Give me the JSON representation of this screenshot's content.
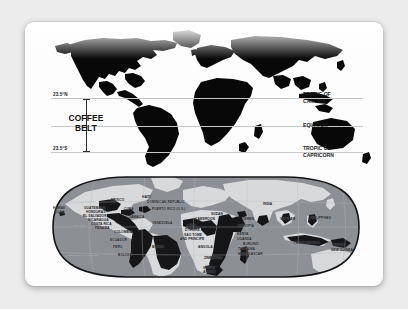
{
  "card": {
    "title": "Coffee Belt World Map"
  },
  "top_map": {
    "belt_label_line1": "COFFEE",
    "belt_label_line2": "BELT",
    "left_labels": {
      "north": "23.5°N",
      "south": "23.5°S"
    },
    "right_labels": {
      "cancer_line1": "TROPIC OF",
      "cancer_line2": "CANCER",
      "equator": "EQUATOR",
      "capricorn_line1": "TROPIC OF",
      "capricorn_line2": "CAPRICORN"
    }
  },
  "bottom_map": {
    "grid_labels": {
      "tropic_cancer": "TROPIC OF CANCER",
      "equator": "EQUATOR",
      "tropic_capricorn": "TROPIC OF CAPRICORN"
    },
    "countries": [
      {
        "name": "HAWAII",
        "x": 18,
        "y": 33,
        "style": ""
      },
      {
        "name": "(U.S.)",
        "x": 20,
        "y": 37,
        "style": ""
      },
      {
        "name": "MEXICO",
        "x": 76,
        "y": 25,
        "style": ""
      },
      {
        "name": "GUATEMALA",
        "x": 49,
        "y": 33,
        "style": ""
      },
      {
        "name": "HONDURAS",
        "x": 51,
        "y": 37,
        "style": ""
      },
      {
        "name": "EL SALVADOR",
        "x": 48,
        "y": 41,
        "style": ""
      },
      {
        "name": "NICARAGUA",
        "x": 53,
        "y": 45,
        "style": ""
      },
      {
        "name": "COSTA RICA",
        "x": 56,
        "y": 49,
        "style": ""
      },
      {
        "name": "PANAMA",
        "x": 60,
        "y": 53,
        "style": ""
      },
      {
        "name": "HAITI",
        "x": 107,
        "y": 22,
        "style": ""
      },
      {
        "name": "DOMINICAN REPUBLIC",
        "x": 112,
        "y": 27,
        "style": ""
      },
      {
        "name": "CUBA",
        "x": 89,
        "y": 34,
        "style": ""
      },
      {
        "name": "PUERTO RICO (U.S.)",
        "x": 117,
        "y": 34,
        "style": ""
      },
      {
        "name": "JAMAICA",
        "x": 94,
        "y": 42,
        "style": ""
      },
      {
        "name": "VENEZUELA",
        "x": 117,
        "y": 48,
        "style": ""
      },
      {
        "name": "COLOMBIA",
        "x": 79,
        "y": 57,
        "style": ""
      },
      {
        "name": "ECUADOR",
        "x": 75,
        "y": 65,
        "style": ""
      },
      {
        "name": "PERU",
        "x": 78,
        "y": 72,
        "style": ""
      },
      {
        "name": "BOLIVIA",
        "x": 83,
        "y": 80,
        "style": ""
      },
      {
        "name": "BRAZIL",
        "x": 117,
        "y": 72,
        "style": ""
      },
      {
        "name": "CÔTE",
        "x": 152,
        "y": 51,
        "style": ""
      },
      {
        "name": "D'IVOIRE",
        "x": 150,
        "y": 55,
        "style": ""
      },
      {
        "name": "SAO TOME",
        "x": 149,
        "y": 60,
        "style": ""
      },
      {
        "name": "AND PRINCIPE",
        "x": 145,
        "y": 64,
        "style": ""
      },
      {
        "name": "CAMEROON",
        "x": 160,
        "y": 44,
        "style": ""
      },
      {
        "name": "SUDAN",
        "x": 176,
        "y": 39,
        "style": ""
      },
      {
        "name": "ANGOLA",
        "x": 163,
        "y": 72,
        "style": ""
      },
      {
        "name": "ZIMBABWE",
        "x": 169,
        "y": 83,
        "style": ""
      },
      {
        "name": "SOUTH",
        "x": 168,
        "y": 93,
        "style": ""
      },
      {
        "name": "AFRICA",
        "x": 168,
        "y": 97,
        "style": ""
      },
      {
        "name": "YEMEN",
        "x": 207,
        "y": 44,
        "style": ""
      },
      {
        "name": "ETHIOPIA",
        "x": 203,
        "y": 51,
        "style": ""
      },
      {
        "name": "KENYA",
        "x": 202,
        "y": 59,
        "style": ""
      },
      {
        "name": "UGANDA",
        "x": 202,
        "y": 64,
        "style": ""
      },
      {
        "name": "BURUNDI",
        "x": 208,
        "y": 69,
        "style": ""
      },
      {
        "name": "TANZANIA",
        "x": 203,
        "y": 74,
        "style": ""
      },
      {
        "name": "MADAGASCAR",
        "x": 203,
        "y": 79,
        "style": ""
      },
      {
        "name": "INDIA",
        "x": 228,
        "y": 29,
        "style": ""
      },
      {
        "name": "VIETNAM",
        "x": 245,
        "y": 44,
        "style": ""
      },
      {
        "name": "PHILIPPINES",
        "x": 275,
        "y": 43,
        "style": ""
      },
      {
        "name": "INDONESIA",
        "x": 259,
        "y": 67,
        "style": "big"
      },
      {
        "name": "PAPUA",
        "x": 298,
        "y": 70,
        "style": ""
      },
      {
        "name": "NEW GUINEA",
        "x": 296,
        "y": 75,
        "style": ""
      }
    ]
  }
}
